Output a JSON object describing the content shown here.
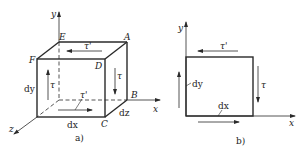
{
  "figure_a": {
    "caption": "a)",
    "vertices": {
      "A": "A",
      "B": "B",
      "C": "C",
      "D": "D",
      "E": "E",
      "F": "F"
    },
    "axes": {
      "x": "x",
      "y": "y",
      "z": "z"
    },
    "dims": {
      "dx": "dx",
      "dy": "dy",
      "dz": "dz"
    },
    "stresses": {
      "tau": "τ",
      "tau_prime": "τ'"
    }
  },
  "figure_b": {
    "caption": "b)",
    "axes": {
      "x": "x",
      "y": "y"
    },
    "dims": {
      "dx": "dx",
      "dy": "dy"
    },
    "stresses": {
      "tau": "τ",
      "tau_prime": "τ'"
    }
  },
  "colors": {
    "line": "#2a2a2a",
    "text": "#222222"
  }
}
